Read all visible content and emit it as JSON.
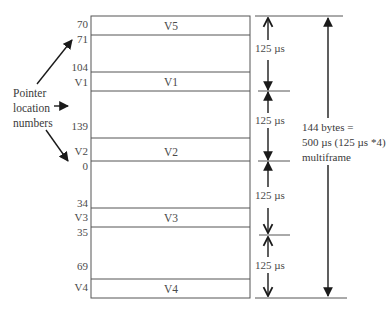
{
  "side_label": {
    "lines": [
      "Pointer",
      "location",
      "numbers"
    ]
  },
  "pointer_numbers": [
    {
      "text": "70",
      "y": 18
    },
    {
      "text": "71",
      "y": 33
    },
    {
      "text": "104",
      "y": 61
    },
    {
      "text": "V1",
      "y": 76
    },
    {
      "text": "139",
      "y": 120
    },
    {
      "text": "V2",
      "y": 145
    },
    {
      "text": "0",
      "y": 160
    },
    {
      "text": "34",
      "y": 197
    },
    {
      "text": "V3",
      "y": 211
    },
    {
      "text": "35",
      "y": 226
    },
    {
      "text": "69",
      "y": 260
    },
    {
      "text": "V4",
      "y": 281
    }
  ],
  "slots": [
    {
      "label": "V5",
      "top": 16,
      "bottom": 35
    },
    {
      "label": "V1",
      "top": 72,
      "bottom": 91
    },
    {
      "label": "V2",
      "top": 138,
      "bottom": 161
    },
    {
      "label": "V3",
      "top": 208,
      "bottom": 227
    },
    {
      "label": "V4",
      "top": 279,
      "bottom": 298
    }
  ],
  "intervals": [
    {
      "label": "125 µs",
      "top": 16,
      "bottom": 91
    },
    {
      "label": "125 µs",
      "top": 91,
      "bottom": 161
    },
    {
      "label": "125 µs",
      "top": 161,
      "bottom": 235
    },
    {
      "label": "125 µs",
      "top": 235,
      "bottom": 298
    }
  ],
  "multiframe": {
    "line1": "144 bytes  =",
    "line2": "500 µs (125 µs *4)",
    "line3": "multiframe"
  },
  "colors": {
    "line": "#555555",
    "arrow": "#1a1a1a",
    "text": "#3a3a3a"
  }
}
